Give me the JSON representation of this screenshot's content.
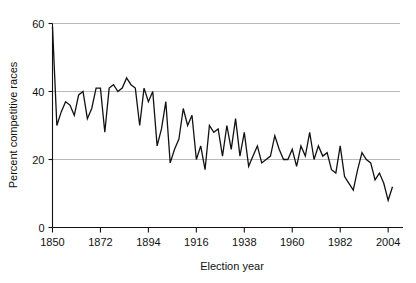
{
  "chart_data": {
    "type": "line",
    "title": "",
    "xlabel": "Election year",
    "ylabel": "Percent competitive races",
    "xlim": [
      1850,
      2006
    ],
    "ylim": [
      0,
      62
    ],
    "xticks": [
      1850,
      1872,
      1894,
      1916,
      1938,
      1960,
      1982,
      2004
    ],
    "yticks": [
      0,
      20,
      40,
      60
    ],
    "grid": "horizontal-gridlines-at-20-40-60",
    "legend": "none",
    "line_color": "#111111",
    "grid_color": "#b9b9b9",
    "axis_color": "#111111",
    "series": [
      {
        "name": "Percent competitive races",
        "x": [
          1850,
          1852,
          1854,
          1856,
          1858,
          1860,
          1862,
          1864,
          1866,
          1868,
          1870,
          1872,
          1874,
          1876,
          1878,
          1880,
          1882,
          1884,
          1886,
          1888,
          1890,
          1892,
          1894,
          1896,
          1898,
          1900,
          1902,
          1904,
          1906,
          1908,
          1910,
          1912,
          1914,
          1916,
          1918,
          1920,
          1922,
          1924,
          1926,
          1928,
          1930,
          1932,
          1934,
          1936,
          1938,
          1940,
          1942,
          1944,
          1946,
          1948,
          1950,
          1952,
          1954,
          1956,
          1958,
          1960,
          1962,
          1964,
          1966,
          1968,
          1970,
          1972,
          1974,
          1976,
          1978,
          1980,
          1982,
          1984,
          1986,
          1988,
          1990,
          1992,
          1994,
          1996,
          1998,
          2000,
          2002,
          2004,
          2006
        ],
        "values": [
          59,
          30,
          34,
          37,
          36,
          33,
          39,
          40,
          32,
          35,
          41,
          41,
          28,
          41,
          42,
          40,
          41,
          44,
          42,
          41,
          30,
          41,
          37,
          40,
          24,
          29,
          37,
          19,
          23,
          26,
          35,
          30,
          33,
          20,
          24,
          17,
          30,
          28,
          29,
          21,
          30,
          23,
          32,
          21,
          28,
          18,
          21,
          24,
          19,
          20,
          21,
          27,
          23,
          20,
          20,
          23,
          18,
          24,
          21,
          28,
          20,
          24,
          21,
          22,
          17,
          16,
          24,
          15,
          13,
          11,
          17,
          22,
          20,
          19,
          14,
          16,
          13,
          8,
          12
        ]
      }
    ]
  },
  "axes": {
    "x_tick_labels": [
      "1850",
      "1872",
      "1894",
      "1916",
      "1938",
      "1960",
      "1982",
      "2004"
    ],
    "y_tick_labels": [
      "0",
      "20",
      "40",
      "60"
    ],
    "x_axis_title": "Election year",
    "y_axis_title": "Percent competitive races"
  }
}
